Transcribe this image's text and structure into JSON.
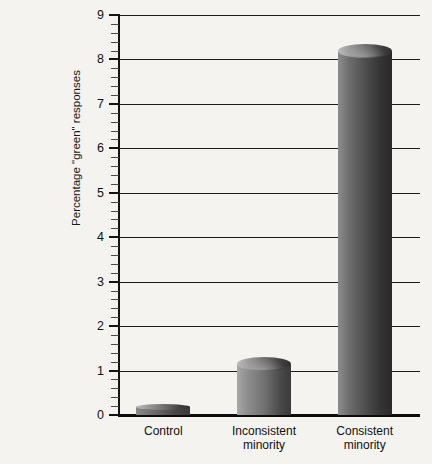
{
  "figure": {
    "top_edge_fragment": "",
    "background_color": "#f4f3ef"
  },
  "chart_data": {
    "type": "bar",
    "title": "",
    "xlabel": "",
    "ylabel": "Percentage \"green\" responses",
    "categories": [
      "Control",
      "Inconsistent minority",
      "Consistent minority"
    ],
    "category_lines": [
      [
        "Control"
      ],
      [
        "Inconsistent",
        "minority"
      ],
      [
        "Consistent",
        "minority"
      ]
    ],
    "values": [
      0.18,
      1.15,
      8.2
    ],
    "ylim": [
      0,
      9
    ],
    "ytick_labels": [
      "0",
      "1",
      "2",
      "3",
      "4",
      "5",
      "6",
      "7",
      "8",
      "9"
    ],
    "ytick_values": [
      0,
      1,
      2,
      3,
      4,
      5,
      6,
      7,
      8,
      9
    ],
    "minor_tick_step": 0.2,
    "grid": "horizontal",
    "legend": "none",
    "bar_color_light": "#a9a9a9",
    "bar_color_dark": "#333333",
    "axis_color": "#141414"
  }
}
